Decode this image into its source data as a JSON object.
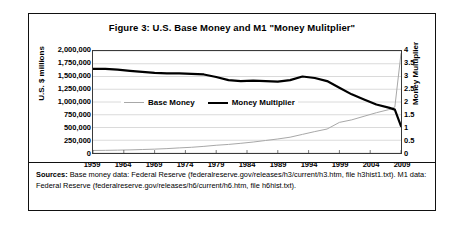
{
  "figure": {
    "title": "Figure 3: U.S. Base Money and M1 \"Money Mulitplier\"",
    "sources_label": "Sources:",
    "sources_text": " Base money data: Federal Reserve (federalreserve.gov/releases/h3/current/h3.htm, file h3hist1.txt). M1 data: Federal Reserve (federalreserve.gov/releases/h6/current/h6.htm, file h6hist.txt)."
  },
  "chart_data": {
    "type": "line",
    "title": "Figure 3: U.S. Base Money and M1 \"Money Mulitplier\"",
    "xlabel": "",
    "ylabel": "U.S. $ millions",
    "y2label": "Money Multiplier",
    "xlim": [
      1959,
      2009
    ],
    "ylim": [
      0,
      2000000
    ],
    "y2lim": [
      0,
      4
    ],
    "grid": true,
    "legend_position": "inside-upper-left",
    "xticks": [
      1959,
      1964,
      1969,
      1974,
      1979,
      1984,
      1989,
      1994,
      1999,
      2004,
      2009
    ],
    "xtick_labels": [
      "1959",
      "1964",
      "1969",
      "1974",
      "1979",
      "1984",
      "1989",
      "1994",
      "1999",
      "2004",
      "2009"
    ],
    "yticks": [
      0,
      250000,
      500000,
      750000,
      1000000,
      1250000,
      1500000,
      1750000,
      2000000
    ],
    "ytick_labels": [
      "0",
      "250,000",
      "500,000",
      "750,000",
      "1,000,000",
      "1,250,000",
      "1,500,000",
      "1,750,000",
      "2,000,000"
    ],
    "y2ticks": [
      0,
      0.5,
      1,
      1.5,
      2,
      2.5,
      3,
      3.5,
      4
    ],
    "y2tick_labels": [
      "0",
      "0.5",
      "1",
      "1.5",
      "2",
      "2.5",
      "3",
      "3.5",
      "4"
    ],
    "x": [
      1959,
      1961,
      1963,
      1965,
      1967,
      1969,
      1971,
      1973,
      1975,
      1977,
      1979,
      1981,
      1983,
      1985,
      1987,
      1989,
      1991,
      1993,
      1995,
      1997,
      1999,
      2001,
      2003,
      2005,
      2007,
      2008,
      2009
    ],
    "series": [
      {
        "name": "Base Money",
        "axis": "left",
        "units": "U.S. $ millions",
        "color": "#a8a8a8",
        "width": 1,
        "values": [
          50000,
          52000,
          56000,
          61000,
          68000,
          76000,
          86000,
          100000,
          112000,
          130000,
          152000,
          168000,
          190000,
          215000,
          245000,
          275000,
          310000,
          365000,
          420000,
          470000,
          600000,
          650000,
          720000,
          790000,
          850000,
          900000,
          1950000
        ]
      },
      {
        "name": "Money Multiplier",
        "axis": "right",
        "units": "ratio",
        "color": "#000000",
        "width": 2.2,
        "values": [
          3.3,
          3.3,
          3.27,
          3.22,
          3.18,
          3.14,
          3.12,
          3.12,
          3.1,
          3.08,
          2.98,
          2.86,
          2.82,
          2.84,
          2.82,
          2.8,
          2.86,
          3.0,
          2.94,
          2.82,
          2.56,
          2.3,
          2.1,
          1.9,
          1.78,
          1.7,
          1.05
        ]
      }
    ],
    "legend": [
      {
        "label": "Base Money",
        "style": "thin-gray-line"
      },
      {
        "label": "Money Multiplier",
        "style": "thick-black-line"
      }
    ]
  }
}
